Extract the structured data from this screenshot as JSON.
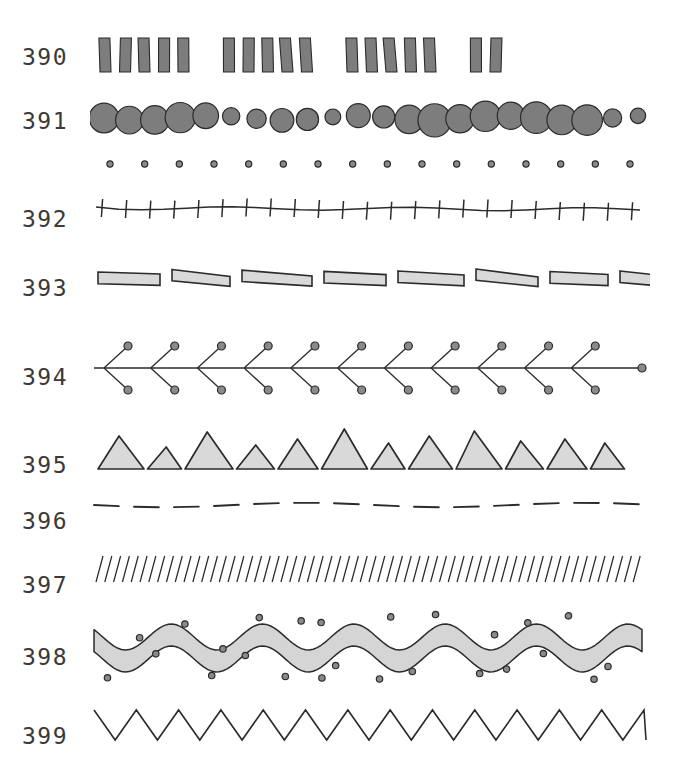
{
  "plate": {
    "title": "Ornament pattern plate",
    "background_color": "#ffffff",
    "ink_color": "#2b2b2b",
    "label_color": "#3a3a3a",
    "width": 677,
    "height": 779
  },
  "palette": {
    "dark_gray_fill": "#7d7d7d",
    "mid_gray_fill": "#8a8a8a",
    "light_gray_fill": "#d9d9d9",
    "ribbon_fill": "#d5d5d5",
    "outline": "#2b2b2b",
    "dot_fill": "#8a8a8a"
  },
  "rows": [
    {
      "label": "390",
      "pattern_name": "grouped-vertical-bars",
      "description": "Four groups of five upright gray rectangles separated by gaps",
      "groups": 4,
      "per_group": 5,
      "last_group_count": 2,
      "fill": "#7d7d7d",
      "label_y": 44,
      "art_y": 34
    },
    {
      "label": "391",
      "pattern_name": "overlapping-circle-chain-with-dot-row",
      "description": "Chain of overlapping dark gray circles above a row of small ring dots",
      "circles": 22,
      "dots": 16,
      "fill": "#7d7d7d",
      "label_y": 108,
      "art_y": 96
    },
    {
      "label": "392",
      "pattern_name": "tick-marked-rule",
      "description": "Slightly wavering horizontal rule crossed by evenly spaced vertical ticks",
      "ticks": 23,
      "label_y": 206,
      "art_y": 192
    },
    {
      "label": "393",
      "pattern_name": "horizontal-block-row",
      "description": "Row of flat light gray outlined rectangles of differing lengths",
      "blocks": 8,
      "fill": "#d9d9d9",
      "label_y": 275,
      "art_y": 262
    },
    {
      "label": "394",
      "pattern_name": "chevron-branch-with-terminal-dots",
      "description": "Horizontal stem with repeating V branches tipped by small circles",
      "branches": 11,
      "fill": "#8a8a8a",
      "label_y": 364,
      "art_y": 336
    },
    {
      "label": "395",
      "pattern_name": "triangle-row",
      "description": "Row of light gray outlined triangles of alternating sizes",
      "triangles": 12,
      "fill": "#d9d9d9",
      "label_y": 452,
      "art_y": 424
    },
    {
      "label": "396",
      "pattern_name": "dashed-rule",
      "description": "Long dashes forming a gently undulating broken line",
      "dashes": 14,
      "label_y": 508,
      "art_y": 494
    },
    {
      "label": "397",
      "pattern_name": "diagonal-hatching",
      "description": "Dense band of short parallel strokes slanting to the right",
      "strokes": 62,
      "label_y": 572,
      "art_y": 552
    },
    {
      "label": "398",
      "pattern_name": "wavy-ribbon-with-scattered-dots",
      "description": "Undulating light gray ribbon band strewn with small dots above and below",
      "waves": 6,
      "dots": 28,
      "fill": "#d5d5d5",
      "label_y": 644,
      "art_y": 608
    },
    {
      "label": "399",
      "pattern_name": "zigzag-line",
      "description": "Continuous sawtooth zigzag line",
      "peaks": 13,
      "label_y": 723,
      "art_y": 700
    }
  ]
}
